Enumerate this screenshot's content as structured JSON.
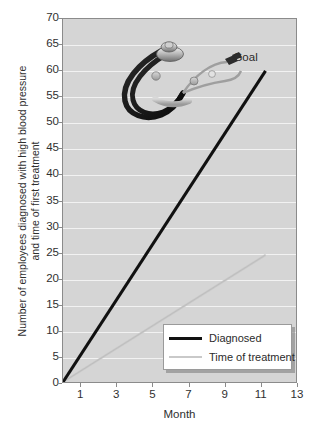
{
  "chart_data": {
    "type": "line",
    "title": "",
    "xlabel": "Month",
    "ylabel": "Number of employees diagnosed with high blood pressure\nand time of first treatment",
    "xlim": [
      0,
      13
    ],
    "ylim": [
      0,
      70
    ],
    "xticks": [
      "1",
      "3",
      "5",
      "7",
      "9",
      "11",
      "13"
    ],
    "xtick_values": [
      1,
      3,
      5,
      7,
      9,
      11,
      13
    ],
    "yticks": [
      "0",
      "5",
      "10",
      "15",
      "20",
      "25",
      "30",
      "35",
      "40",
      "45",
      "50",
      "55",
      "60",
      "65",
      "70"
    ],
    "ytick_values": [
      0,
      5,
      10,
      15,
      20,
      25,
      30,
      35,
      40,
      45,
      50,
      55,
      60,
      65,
      70
    ],
    "grid": "horizontal",
    "legend_position": "bottom-right-inside",
    "series": [
      {
        "name": "Diagnosed",
        "color": "#111111",
        "x": [
          0,
          11.3
        ],
        "values": [
          0,
          60
        ]
      },
      {
        "name": "Time of treatment",
        "color": "#c9c9c9",
        "x": [
          0,
          11.3
        ],
        "values": [
          0,
          24.5
        ]
      }
    ],
    "annotations": [
      {
        "text": "Goal",
        "x": 10.2,
        "y": 62.5
      }
    ],
    "decorations": [
      {
        "name": "stethoscope-photo",
        "x": 2.0,
        "y": 68.0
      }
    ]
  },
  "legend": {
    "items": [
      {
        "label": "Diagnosed",
        "swatch": "thick-black-line"
      },
      {
        "label": "Time of treatment",
        "swatch": "thin-gray-line"
      }
    ]
  },
  "colors": {
    "plot_background": "#d5d5d5",
    "page_background": "#ffffff",
    "gridline": "#f2f2f2",
    "axis": "#8b8b8b",
    "series_diagnosed": "#111111",
    "series_treatment": "#c9c9c9",
    "text": "#2f2f2f"
  }
}
